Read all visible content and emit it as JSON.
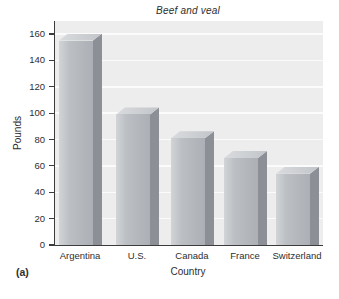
{
  "panel_label": "(a)",
  "chart_data": {
    "type": "bar",
    "title": "Beef and veal",
    "xlabel": "Country",
    "ylabel": "Pounds",
    "categories": [
      "Argentina",
      "U.S.",
      "Canada",
      "France",
      "Switzerland"
    ],
    "values": [
      155,
      99,
      81,
      66,
      54
    ],
    "ylim": [
      0,
      160
    ],
    "yticks": [
      0,
      20,
      40,
      60,
      80,
      100,
      120,
      140,
      160
    ],
    "grid": "horizontal gridlines at every y tick, white on light gray panel",
    "legend": "none",
    "style": "pseudo-3d-gray-bars",
    "colors": {
      "plot_background": "#ededee",
      "gridline": "#fbfbfc",
      "axis": "#3c3c3c",
      "bar_front_left": "#d2d4d7",
      "bar_front_mid": "#bcc0c4",
      "bar_front_right": "#acb0b6",
      "bar_side": "#8c9096",
      "bar_top_left": "#d9dbde",
      "bar_top_right": "#c2c5c9",
      "text": "#2e2e2e"
    }
  }
}
